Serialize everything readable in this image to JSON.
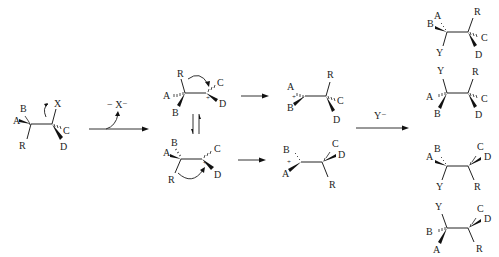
{
  "diagram": {
    "reagents": {
      "loss": "− X⁻",
      "nucleophile": "Y⁻"
    },
    "charge": "+",
    "substrate": {
      "left": [
        "A",
        "B",
        "R"
      ],
      "right": [
        "X",
        "C",
        "D"
      ]
    },
    "cation_top": {
      "left": [
        "R",
        "A",
        "B"
      ],
      "right": [
        "C",
        "D"
      ]
    },
    "cation_bottom": {
      "left": [
        "B",
        "A",
        "R"
      ],
      "right": [
        "C",
        "D"
      ]
    },
    "bridged_top": {
      "left": [
        "A",
        "B"
      ],
      "right": [
        "R",
        "C",
        "D"
      ]
    },
    "bridged_bottom": {
      "left": [
        "B",
        "A"
      ],
      "right": [
        "C",
        "D",
        "R"
      ]
    },
    "products": [
      {
        "left": [
          "A",
          "B",
          "Y"
        ],
        "right": [
          "R",
          "C",
          "D"
        ]
      },
      {
        "left": [
          "Y",
          "A",
          "B"
        ],
        "right": [
          "R",
          "C",
          "D"
        ]
      },
      {
        "left": [
          "B",
          "A",
          "Y"
        ],
        "right": [
          "C",
          "D",
          "R"
        ]
      },
      {
        "left": [
          "Y",
          "B",
          "A"
        ],
        "right": [
          "C",
          "D",
          "R"
        ]
      }
    ],
    "colors": {
      "ink": "#222222",
      "background": "#ffffff"
    }
  }
}
